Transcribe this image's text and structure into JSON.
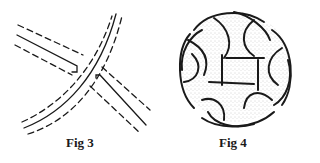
{
  "figures": [
    {
      "id": "fig3",
      "caption": "Fig 3",
      "description": "Two crossing bands, each drawn as a solid center line flanked by dashed edges; the diagonal band passes over the other"
    },
    {
      "id": "fig4",
      "caption": "Fig 4",
      "description": "Circular interlaced knotwork pattern with stippled background"
    }
  ],
  "colors": {
    "ink": "#1a1a1a",
    "paper": "#ffffff",
    "stipple": "#9a9a9a"
  }
}
